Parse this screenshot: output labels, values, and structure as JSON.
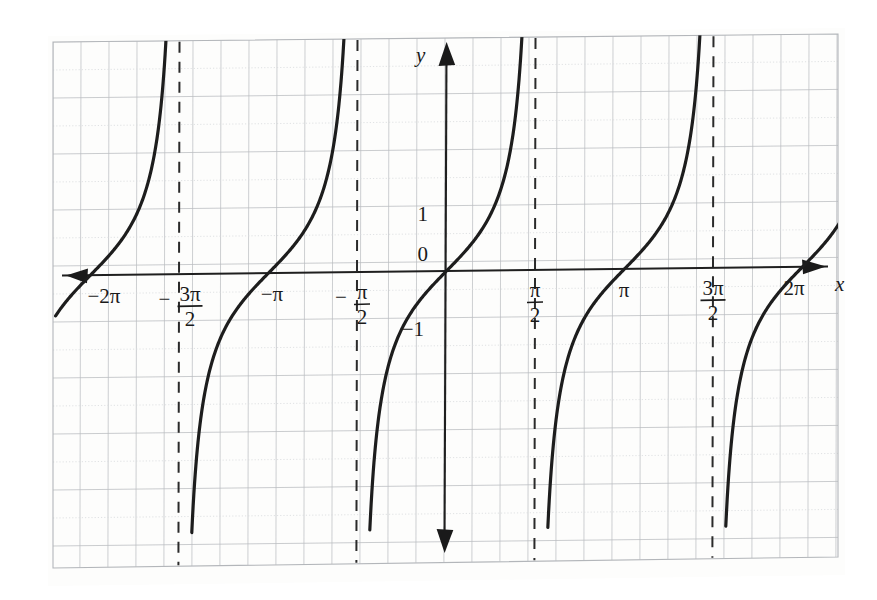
{
  "figure": {
    "kind": "graph-paper-plot",
    "caption_text": "",
    "background_color": "#fefefe",
    "paper_tint": "#fdfdfb"
  },
  "axes": {
    "x_axis_label": "x",
    "y_axis_label": "y",
    "origin_label": "0",
    "x_arrow_both_ends": true,
    "y_arrow_both_ends": true,
    "axis_color": "#1f1f1f",
    "x_tick_labels": [
      {
        "id": "neg-2pi",
        "text": "−2π",
        "value": -6.283,
        "style": "plain"
      },
      {
        "id": "neg-3pi-2",
        "text": "−3π/2",
        "numerator": "3π",
        "denominator": "2",
        "sign": "−",
        "value": -4.712,
        "style": "fraction"
      },
      {
        "id": "neg-pi",
        "text": "−π",
        "value": -3.142,
        "style": "plain"
      },
      {
        "id": "neg-pi-2",
        "text": "−π/2",
        "numerator": "π",
        "denominator": "2",
        "sign": "−",
        "value": -1.571,
        "style": "fraction"
      },
      {
        "id": "pi-2",
        "text": "π/2",
        "numerator": "π",
        "denominator": "2",
        "sign": "",
        "value": 1.571,
        "style": "fraction"
      },
      {
        "id": "pi",
        "text": "π",
        "value": 3.142,
        "style": "plain"
      },
      {
        "id": "3pi-2",
        "text": "3π/2",
        "numerator": "3π",
        "denominator": "2",
        "sign": "",
        "value": 4.712,
        "style": "fraction"
      },
      {
        "id": "2pi",
        "text": "2π",
        "value": 6.283,
        "style": "plain"
      }
    ],
    "y_tick_labels": [
      {
        "id": "y-one",
        "text": "1",
        "value": 1
      },
      {
        "id": "y-zero",
        "text": "0",
        "value": 0
      },
      {
        "id": "y-neg-one",
        "text": "−1",
        "value": -1
      }
    ]
  },
  "chart_data": {
    "type": "line",
    "title": "",
    "subtitle": "",
    "xlabel": "x",
    "ylabel": "y",
    "function": "y = tan x",
    "xlim": [
      -6.9,
      7.0
    ],
    "ylim": [
      -4.1,
      4.1
    ],
    "x_unit_pixels": 178,
    "y_unit_pixels": 57,
    "grid": true,
    "grid_color": "#b9bcc0",
    "grid_minor_color": "#d9dbdd",
    "grid_cell_px": 28,
    "legend": "none",
    "curve_color": "#1d1d1d",
    "curve_width": 3.2,
    "asymptote_style": "dashed",
    "asymptote_color": "#2a2a2a",
    "asymptotes": [
      {
        "id": "asym-neg-3pi-2",
        "x": -4.712,
        "label": "−3π/2"
      },
      {
        "id": "asym-neg-pi-2",
        "x": -1.571,
        "label": "−π/2"
      },
      {
        "id": "asym-pi-2",
        "x": 1.571,
        "label": "π/2"
      },
      {
        "id": "asym-3pi-2",
        "x": 4.712,
        "label": "3π/2"
      }
    ],
    "branches": [
      {
        "id": "branch-neg-3",
        "center_x": -6.283,
        "x_from": -6.9,
        "x_to": -4.712,
        "zero_at": -6.283
      },
      {
        "id": "branch-neg-2",
        "center_x": -3.142,
        "x_from": -4.712,
        "x_to": -1.571,
        "zero_at": -3.142
      },
      {
        "id": "branch-0",
        "center_x": 0.0,
        "x_from": -1.571,
        "x_to": 1.571,
        "zero_at": 0.0
      },
      {
        "id": "branch-1",
        "center_x": 3.142,
        "x_from": 1.571,
        "x_to": 4.712,
        "zero_at": 3.142
      },
      {
        "id": "branch-2",
        "center_x": 6.283,
        "x_from": 4.712,
        "x_to": 7.0,
        "zero_at": 6.283
      }
    ],
    "x_intercepts": [
      -6.283,
      -3.142,
      0,
      3.142,
      6.283
    ],
    "period": 3.142,
    "notable_points": [
      {
        "x": -0.785,
        "y": -1
      },
      {
        "x": 0,
        "y": 0
      },
      {
        "x": 0.785,
        "y": 1
      },
      {
        "x": 2.356,
        "y": -1
      },
      {
        "x": 3.142,
        "y": 0
      },
      {
        "x": 3.927,
        "y": 1
      }
    ]
  }
}
